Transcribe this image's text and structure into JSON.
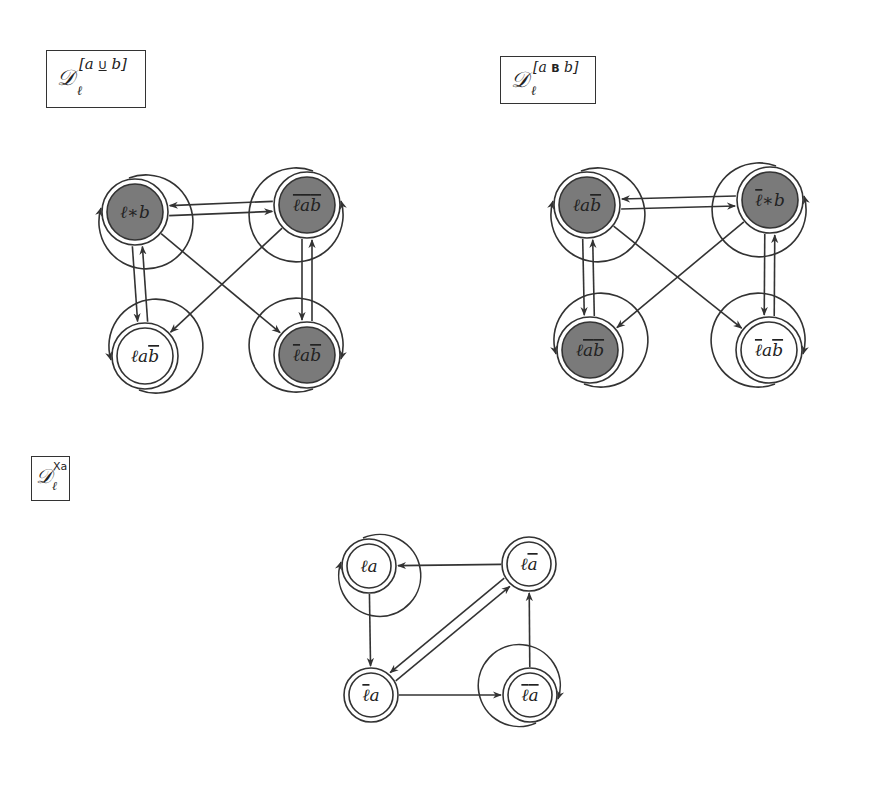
{
  "diagrams": [
    {
      "id": "D_until",
      "label": {
        "main": "𝒟",
        "sub": "ℓ",
        "sup": "[a U b]",
        "sup_text": "[a ",
        "sup_op": "U",
        "sup_end": " b]"
      },
      "nodes": [
        {
          "id": "n1",
          "label": "ℓ∗b",
          "parts": [
            "ℓ",
            "∗",
            "b"
          ],
          "overline": [
            false,
            false,
            false
          ],
          "filled": true
        },
        {
          "id": "n2",
          "label": "ℓ̄āb̄",
          "parts": [
            "ℓ",
            "a",
            "b"
          ],
          "overline": [
            true,
            true,
            true
          ],
          "filled": true
        },
        {
          "id": "n3",
          "label": "ℓab̄",
          "parts": [
            "ℓ",
            "a",
            "b"
          ],
          "overline": [
            false,
            false,
            true
          ],
          "filled": false
        },
        {
          "id": "n4",
          "label": "ℓ̄ab̄",
          "parts": [
            "ℓ",
            "a",
            "b"
          ],
          "overline": [
            true,
            false,
            true
          ],
          "filled": true
        }
      ],
      "edges": [
        [
          "n1",
          "n1"
        ],
        [
          "n2",
          "n2"
        ],
        [
          "n3",
          "n3"
        ],
        [
          "n4",
          "n4"
        ],
        [
          "n1",
          "n2"
        ],
        [
          "n2",
          "n1"
        ],
        [
          "n1",
          "n3"
        ],
        [
          "n3",
          "n1"
        ],
        [
          "n2",
          "n4"
        ],
        [
          "n4",
          "n2"
        ],
        [
          "n1",
          "n4"
        ],
        [
          "n2",
          "n3"
        ]
      ]
    },
    {
      "id": "D_before",
      "label": {
        "main": "𝒟",
        "sub": "ℓ",
        "sup": "[a B b]",
        "sup_text": "[a ",
        "sup_op": "B",
        "sup_end": " b]"
      },
      "nodes": [
        {
          "id": "n1",
          "label": "ℓab̄",
          "parts": [
            "ℓ",
            "a",
            "b"
          ],
          "overline": [
            false,
            false,
            true
          ],
          "filled": true
        },
        {
          "id": "n2",
          "label": "ℓ̄∗b",
          "parts": [
            "ℓ",
            "∗",
            "b"
          ],
          "overline": [
            true,
            false,
            false
          ],
          "filled": true
        },
        {
          "id": "n3",
          "label": "ℓāb̄",
          "parts": [
            "ℓ",
            "a",
            "b"
          ],
          "overline": [
            false,
            true,
            true
          ],
          "filled": true
        },
        {
          "id": "n4",
          "label": "ℓ̄ab̄",
          "parts": [
            "ℓ",
            "a",
            "b"
          ],
          "overline": [
            true,
            false,
            true
          ],
          "filled": false
        }
      ],
      "edges": [
        [
          "n1",
          "n1"
        ],
        [
          "n2",
          "n2"
        ],
        [
          "n3",
          "n3"
        ],
        [
          "n4",
          "n4"
        ],
        [
          "n1",
          "n2"
        ],
        [
          "n2",
          "n1"
        ],
        [
          "n1",
          "n3"
        ],
        [
          "n3",
          "n1"
        ],
        [
          "n2",
          "n4"
        ],
        [
          "n4",
          "n2"
        ],
        [
          "n1",
          "n4"
        ],
        [
          "n2",
          "n3"
        ]
      ]
    },
    {
      "id": "D_next",
      "label": {
        "main": "𝒟",
        "sub": "ℓ",
        "sup": "Xa",
        "sup_text": "",
        "sup_op": "X",
        "sup_end": "a"
      },
      "nodes": [
        {
          "id": "n1",
          "label": "ℓa",
          "parts": [
            "ℓ",
            "a"
          ],
          "overline": [
            false,
            false
          ],
          "filled": false
        },
        {
          "id": "n2",
          "label": "ℓā",
          "parts": [
            "ℓ",
            "a"
          ],
          "overline": [
            false,
            true
          ],
          "filled": false
        },
        {
          "id": "n3",
          "label": "ℓ̄a",
          "parts": [
            "ℓ",
            "a"
          ],
          "overline": [
            true,
            false
          ],
          "filled": false
        },
        {
          "id": "n4",
          "label": "ℓ̄ā",
          "parts": [
            "ℓ",
            "a"
          ],
          "overline": [
            true,
            true
          ],
          "filled": false
        }
      ],
      "edges": [
        [
          "n1",
          "n1"
        ],
        [
          "n4",
          "n4"
        ],
        [
          "n2",
          "n1"
        ],
        [
          "n1",
          "n3"
        ],
        [
          "n3",
          "n2"
        ],
        [
          "n2",
          "n3"
        ],
        [
          "n3",
          "n4"
        ],
        [
          "n4",
          "n2"
        ]
      ]
    }
  ],
  "colors": {
    "filled_node": "#7a7a7a",
    "stroke": "#333333",
    "background": "#ffffff"
  }
}
